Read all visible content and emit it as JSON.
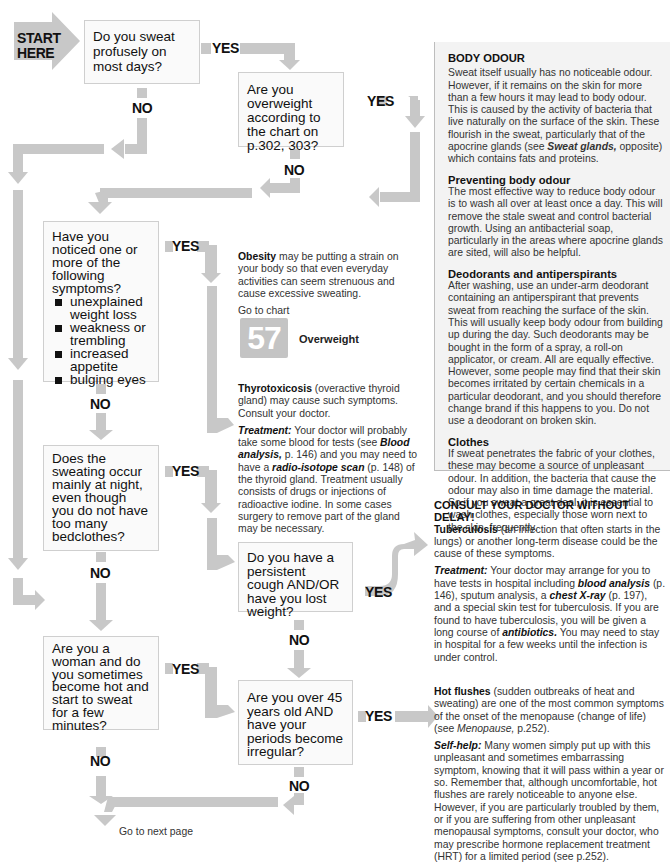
{
  "start": {
    "line1": "START",
    "line2": "HERE"
  },
  "labels": {
    "yes": "YES",
    "no": "NO"
  },
  "questions": {
    "q1": "Do you sweat profusely on most days?",
    "q2": "Are you overweight according to the chart on p.302, 303?",
    "q3": {
      "text": "Have you noticed one or more of the following symptoms?",
      "items": [
        "unexplained weight loss",
        "weakness or trembling",
        "increased appetite",
        "bulging eyes"
      ]
    },
    "q4": "Does the sweating occur mainly at night, even though you do not have too many bedclothes?",
    "q5": "Do you have a persistent cough AND/OR have you lost weight?",
    "q6": "Are you a woman and do you sometimes become hot and start to sweat for a few minutes?",
    "q7": "Are you over 45 years old AND have your periods become irregular?"
  },
  "outcomes": {
    "obesity": {
      "term": "Obesity",
      "text": " may be putting a strain on your body so that even everyday activities can seem strenuous and cause excessive sweating.",
      "goto": "Go to chart",
      "chart_number": "57",
      "chart_name": "Overweight"
    },
    "thyro": {
      "term": "Thyrotoxicosis",
      "text": " (overactive thyroid gland) may cause such symptoms. Consult your doctor.",
      "treat_label": "Treatment:",
      "treat_1": " Your doctor will probably take some blood for tests (see ",
      "link1": "Blood analysis,",
      "treat_2": " p. 146) and you may need to have a ",
      "link2": "radio-isotope scan",
      "treat_3": " (p. 148) of the thyroid gland. Treatment usually consists of drugs or injections of radioactive iodine. In some cases surgery to remove part of the gland may be necessary."
    },
    "tb": {
      "heading": "CONSULT YOUR DOCTOR WITHOUT DELAY!",
      "term": "Tuberculosis",
      "text": " (an infection that often starts in the lungs) or another long-term disease could be the cause of these symptoms.",
      "treat_label": "Treatment:",
      "treat_1": " Your doctor may arrange for you to have tests in hospital including ",
      "link1": "blood analysis",
      "treat_2": " (p. 146), sputum analysis, a ",
      "link2": "chest X-ray",
      "treat_3": " (p. 197), and a special skin test for tuberculosis. If you are found to have tuberculosis, you will be given a long course of ",
      "link3": "antibiotics.",
      "treat_4": " You may need to stay in hospital for a few weeks until the infection is under control."
    },
    "hot": {
      "term": "Hot flushes",
      "text": " (sudden outbreaks of heat and sweating) are one of the most common symptoms of the onset of the menopause (change of life) (see ",
      "link1": "Menopause,",
      "text2": " p.252).",
      "help_label": "Self-help:",
      "help": " Many women simply put up with this unpleasant and sometimes embarrassing symptom, knowing that it will pass within a year or so. Remember that, although uncomfortable, hot flushes are rarely noticeable to anyone else. However, if you are particularly troubled by them, or if you are suffering from other unpleasant menopausal symptoms, consult your doctor, who may prescribe hormone replacement treatment (HRT) for a limited period (see p.252)."
    }
  },
  "panel": {
    "title": "BODY ODOUR",
    "intro_1": "Sweat itself usually has no noticeable odour. However, if it remains on the skin for more than a few hours it may lead to body odour. This is caused by the activity of bacteria that live naturally on the surface of the skin. These flourish in the sweat, particularly that of the apocrine glands (see ",
    "intro_link": "Sweat glands,",
    "intro_2": " opposite) which contains fats and proteins.",
    "s1_title": "Preventing body odour",
    "s1_text": "The most effective way to reduce body odour is to wash all over at least once a day. This will remove the stale sweat and control bacterial growth. Using an antibacterial soap, particularly in the areas where apocrine glands are sited, will also be helpful.",
    "s2_title": "Deodorants and antiperspirants",
    "s2_text": "After washing, use an under-arm deodorant containing an antiperspirant that prevents sweat from reaching the surface of the skin. This will usually keep body odour from building up during the day. Such deodorants may be bought in the form of a spray, a roll-on applicator, or cream. All are equally effective. However, some people may find that their skin becomes irritated by certain chemicals in a particular deodorant, and you should therefore change brand if this happens to you. Do not use a deodorant on broken skin.",
    "s3_title": "Clothes",
    "s3_text": "If sweat penetrates the fabric of your clothes, these may become a source of unpleasant odour. In addition, the bacteria that cause the odour may also in time damage the material. So if you sweat a great deal, it is essential to wash clothes, especially those worn next to the skin, frequently."
  },
  "footer_partial": "Go to next page",
  "colors": {
    "arrow": "#c8c8c8",
    "box_border": "#cfcfcf",
    "panel_bg": "#f3f3f3",
    "chart_badge": "#c4c4c4"
  }
}
